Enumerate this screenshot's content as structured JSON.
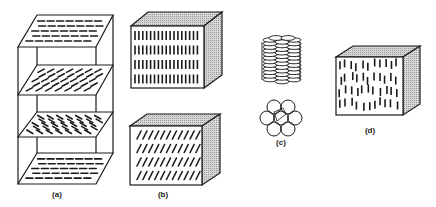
{
  "figure": {
    "panels": [
      {
        "id": "a",
        "label": "(a)",
        "kind": "stacked-planes-twisted",
        "planes": 4,
        "orientations_deg": [
          0,
          -30,
          30,
          0
        ]
      },
      {
        "id": "b",
        "label": "(b)",
        "kind": "smectic-cubes",
        "cubes": [
          {
            "orientation": "vertical",
            "rows": 4
          },
          {
            "orientation": "tilted",
            "rows": 4
          }
        ]
      },
      {
        "id": "c",
        "label": "(c)",
        "kind": "columnar-discotic",
        "stack_discs": 12,
        "hex_circles": 7
      },
      {
        "id": "d",
        "label": "(d)",
        "kind": "nematic-cube",
        "orientation": "vertical-random"
      }
    ]
  },
  "labels": {
    "a": "(a)",
    "b": "(b)",
    "c": "(c)",
    "d": "(d)"
  },
  "colors": {
    "line": "#1a1a1a",
    "shade": "#c4c4c4",
    "background": "#ffffff"
  }
}
